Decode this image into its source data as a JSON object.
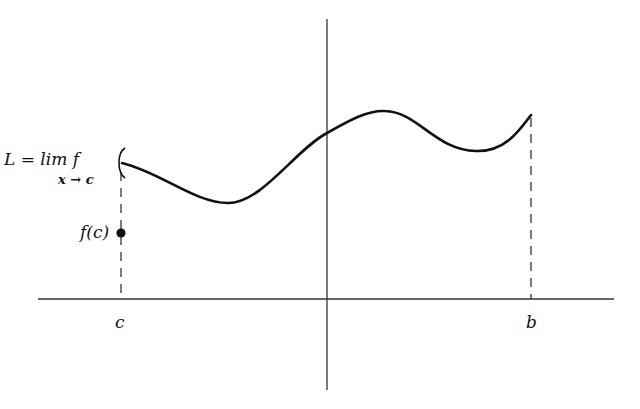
{
  "diagram": {
    "labels": {
      "limit_line1": "L = lim f",
      "limit_line2": "x → c",
      "fc": "f(c)",
      "c": "c",
      "b": "b"
    },
    "colors": {
      "ink": "#111111",
      "axis": "#333333",
      "background": "#ffffff"
    },
    "axes": {
      "horizontal": {
        "x1": 38,
        "x2": 614,
        "y": 299
      },
      "vertical": {
        "x": 327,
        "y1": 19,
        "y2": 390
      }
    },
    "points": {
      "limit_point": {
        "x": 121,
        "y": 163,
        "style": "open-bracket"
      },
      "fc_point": {
        "x": 121,
        "y": 233,
        "style": "filled-dot"
      },
      "b_endpoint": {
        "x": 531,
        "y": 115
      }
    }
  }
}
